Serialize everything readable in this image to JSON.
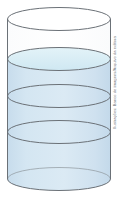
{
  "figure": {
    "name": "partially-filled-cylinder",
    "credit": "Ilustrações: Banco de imagens/Arquivo da editora",
    "canvas": {
      "width": 127,
      "height": 199,
      "background": "#ffffff"
    },
    "colors": {
      "outline": "#6b7177",
      "liquid_fill": "#cfe1ef",
      "liquid_fill_light": "#dcebf5",
      "surface_fill": "#d8eef4",
      "empty_fill": "#ffffff",
      "credit_text": "#6f7578"
    },
    "geometry": {
      "center_x": 59,
      "radius_x": 51.5,
      "radius_y": 11.5,
      "top_rim_y": 19,
      "base_y": 179,
      "body_left_x": 7.5,
      "body_right_x": 110.5,
      "stroke_width": 1
    },
    "levels": [
      {
        "id": "top-rim",
        "label": "Borda superior do cilindro",
        "y": 19,
        "kind": "rim"
      },
      {
        "id": "liquid-surface",
        "label": "Superficie do liquido",
        "y": 59,
        "kind": "surface"
      },
      {
        "id": "division-1",
        "label": "Primeira divisao",
        "y": 96,
        "kind": "division"
      },
      {
        "id": "division-2",
        "label": "Segunda divisao",
        "y": 132,
        "kind": "division"
      },
      {
        "id": "base",
        "label": "Base do cilindro",
        "y": 179,
        "kind": "base"
      }
    ],
    "layers": [
      {
        "id": "empty-layer",
        "label": "Parte vazia do cilindro",
        "filled": false,
        "top_y": 19,
        "bottom_y": 59
      },
      {
        "id": "liquid-layer-1",
        "label": "Primeira camada de liquido",
        "filled": true,
        "top_y": 59,
        "bottom_y": 96
      },
      {
        "id": "liquid-layer-2",
        "label": "Segunda camada de liquido",
        "filled": true,
        "top_y": 96,
        "bottom_y": 132
      },
      {
        "id": "liquid-layer-3",
        "label": "Terceira camada de liquido",
        "filled": true,
        "top_y": 132,
        "bottom_y": 179
      }
    ]
  }
}
